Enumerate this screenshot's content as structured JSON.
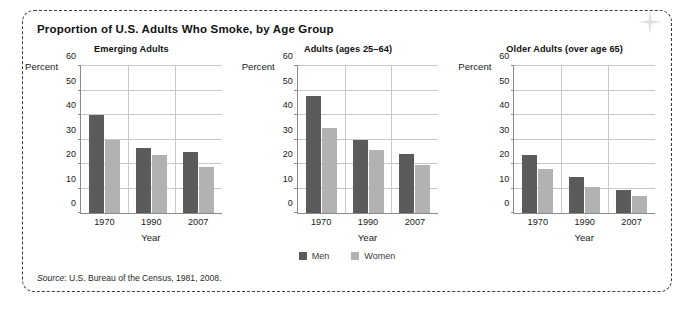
{
  "figure": {
    "title": "Proportion of U.S. Adults Who Smoke, by Age Group",
    "source_word": "Source",
    "source_text": ": U.S. Bureau of the Census, 1981, 2008."
  },
  "legend": {
    "men_label": "Men",
    "women_label": "Women"
  },
  "colors": {
    "men": "#5b5b5b",
    "women": "#b2b2b2",
    "grid": "#c9c9c9",
    "axis": "#8a8a8a",
    "frame": "#3d3d3d"
  },
  "chart_data": [
    {
      "type": "bar",
      "title": "Emerging Adults",
      "xlabel": "Year",
      "ylabel": "Percent",
      "ylim": [
        0,
        60
      ],
      "yticks": [
        0,
        10,
        20,
        30,
        40,
        50,
        60
      ],
      "grid": true,
      "legend_position": "bottom-center",
      "categories": [
        "1970",
        "1990",
        "2007"
      ],
      "series": [
        {
          "name": "Men",
          "values": [
            40.0,
            26.4,
            25.1
          ]
        },
        {
          "name": "Women",
          "values": [
            30.0,
            23.5,
            18.8
          ]
        }
      ]
    },
    {
      "type": "bar",
      "title": "Adults (ages 25–64)",
      "xlabel": "Year",
      "ylabel": "Percent",
      "ylim": [
        0,
        60
      ],
      "yticks": [
        0,
        10,
        20,
        30,
        40,
        50,
        60
      ],
      "grid": true,
      "legend_position": "bottom-center",
      "categories": [
        "1970",
        "1990",
        "2007"
      ],
      "series": [
        {
          "name": "Men",
          "values": [
            47.8,
            29.6,
            24.0
          ]
        },
        {
          "name": "Women",
          "values": [
            34.6,
            25.6,
            19.4
          ]
        }
      ]
    },
    {
      "type": "bar",
      "title": "Older Adults (over age 65)",
      "xlabel": "Year",
      "ylabel": "Percent",
      "ylim": [
        0,
        60
      ],
      "yticks": [
        0,
        10,
        20,
        30,
        40,
        50,
        60
      ],
      "grid": true,
      "legend_position": "bottom-center",
      "categories": [
        "1970",
        "1990",
        "2007"
      ],
      "series": [
        {
          "name": "Men",
          "values": [
            23.6,
            14.8,
            9.2
          ]
        },
        {
          "name": "Women",
          "values": [
            17.8,
            10.7,
            7.0
          ]
        }
      ]
    }
  ]
}
